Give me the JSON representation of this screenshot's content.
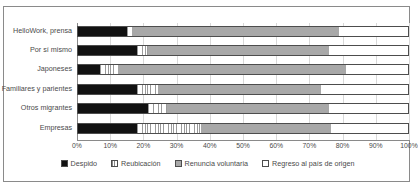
{
  "title": {
    "text": ""
  },
  "chart_data": {
    "type": "bar",
    "orientation": "horizontal",
    "stacked": true,
    "stack_mode": "percent",
    "title": "",
    "xlabel": "",
    "ylabel": "",
    "xlim": [
      0,
      100
    ],
    "xticks": [
      "0%",
      "10%",
      "20%",
      "30%",
      "40%",
      "50%",
      "60%",
      "70%",
      "80%",
      "90%",
      "100%"
    ],
    "xtick_values": [
      0,
      10,
      20,
      30,
      40,
      50,
      60,
      70,
      80,
      90,
      100
    ],
    "grid": true,
    "grid_axis": "x",
    "legend_position": "bottom",
    "categories": [
      "HelloWork, prensa",
      "Por sí mismo",
      "Japoneses",
      "Familiares y parientes",
      "Otros migrantes",
      "Empresas"
    ],
    "series": [
      {
        "name": "Despido",
        "color": "#121212",
        "pattern": "solid",
        "values": [
          15.0,
          18.0,
          7.0,
          18.0,
          21.5,
          18.0
        ]
      },
      {
        "name": "Reubicación",
        "color": "#ffffff",
        "pattern": "vertical-hatch",
        "values": [
          1.5,
          3.5,
          5.5,
          6.5,
          5.5,
          19.5
        ]
      },
      {
        "name": "Renuncia voluntaria",
        "color": "#a8a8a8",
        "pattern": "solid",
        "values": [
          62.5,
          54.5,
          68.5,
          49.0,
          49.0,
          39.0
        ]
      },
      {
        "name": "Regreso al país de origen",
        "color": "#ffffff",
        "pattern": "solid",
        "values": [
          21.0,
          24.0,
          19.0,
          26.5,
          24.0,
          23.5
        ]
      }
    ]
  }
}
